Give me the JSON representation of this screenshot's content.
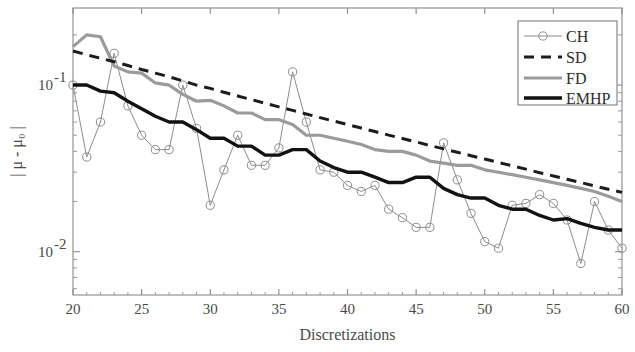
{
  "chart_data": {
    "type": "line",
    "title": "",
    "xlabel": "Discretizations",
    "ylabel": "| μ - μ₀ |",
    "yscale": "log",
    "xlim": [
      20,
      60
    ],
    "ylim": [
      0.0055,
      0.29
    ],
    "xticks": [
      20,
      25,
      30,
      35,
      40,
      45,
      50,
      55,
      60
    ],
    "xticklabels": [
      "20",
      "25",
      "30",
      "35",
      "40",
      "45",
      "50",
      "55",
      "60"
    ],
    "yticks": [
      0.1,
      0.01
    ],
    "yticklabels": [
      "10⁻¹",
      "10⁻²"
    ],
    "grid": false,
    "legend_position": "top-right",
    "x": [
      20,
      21,
      22,
      23,
      24,
      25,
      26,
      27,
      28,
      29,
      30,
      31,
      32,
      33,
      34,
      35,
      36,
      37,
      38,
      39,
      40,
      41,
      42,
      43,
      44,
      45,
      46,
      47,
      48,
      49,
      50,
      51,
      52,
      53,
      54,
      55,
      56,
      57,
      58,
      59,
      60
    ],
    "series": [
      {
        "name": "CH",
        "style": "thin-gray-circles",
        "color": "#8d8d8d",
        "marker": "circle",
        "values": [
          0.1,
          0.037,
          0.06,
          0.155,
          0.075,
          0.05,
          0.041,
          0.041,
          0.1,
          0.055,
          0.019,
          0.031,
          0.05,
          0.033,
          0.033,
          0.042,
          0.12,
          0.06,
          0.031,
          0.03,
          0.025,
          0.023,
          0.025,
          0.018,
          0.016,
          0.014,
          0.014,
          0.045,
          0.027,
          0.017,
          0.0115,
          0.0105,
          0.019,
          0.0195,
          0.022,
          0.0195,
          0.0155,
          0.0085,
          0.02,
          0.0135,
          0.0105
        ]
      },
      {
        "name": "SD",
        "style": "dashed-black",
        "color": "#1c1c1c",
        "marker": "none",
        "values": [
          0.16,
          0.152,
          0.145,
          0.138,
          0.131,
          0.124,
          0.118,
          0.112,
          0.106,
          0.1,
          0.0955,
          0.0905,
          0.086,
          0.0818,
          0.0778,
          0.074,
          0.0705,
          0.067,
          0.0638,
          0.0608,
          0.058,
          0.0552,
          0.0526,
          0.0501,
          0.0478,
          0.0456,
          0.0434,
          0.0414,
          0.0395,
          0.0377,
          0.036,
          0.0343,
          0.0328,
          0.0313,
          0.0298,
          0.0285,
          0.0272,
          0.026,
          0.0248,
          0.0237,
          0.0227
        ]
      },
      {
        "name": "FD",
        "style": "solid-gray",
        "color": "#9b9b9b",
        "marker": "none",
        "values": [
          0.17,
          0.2,
          0.195,
          0.13,
          0.12,
          0.118,
          0.103,
          0.1,
          0.088,
          0.08,
          0.081,
          0.075,
          0.068,
          0.068,
          0.062,
          0.062,
          0.058,
          0.05,
          0.05,
          0.048,
          0.046,
          0.044,
          0.041,
          0.04,
          0.04,
          0.038,
          0.035,
          0.034,
          0.033,
          0.033,
          0.031,
          0.03,
          0.029,
          0.028,
          0.027,
          0.026,
          0.025,
          0.024,
          0.023,
          0.0215,
          0.02
        ]
      },
      {
        "name": "EMHP",
        "style": "thick-black",
        "color": "#121212",
        "marker": "none",
        "values": [
          0.1,
          0.1,
          0.092,
          0.09,
          0.08,
          0.072,
          0.065,
          0.06,
          0.06,
          0.054,
          0.048,
          0.048,
          0.043,
          0.043,
          0.038,
          0.038,
          0.041,
          0.041,
          0.035,
          0.032,
          0.03,
          0.03,
          0.028,
          0.026,
          0.026,
          0.028,
          0.028,
          0.024,
          0.022,
          0.021,
          0.021,
          0.019,
          0.018,
          0.018,
          0.0165,
          0.0155,
          0.0158,
          0.0148,
          0.014,
          0.0135,
          0.0135
        ]
      }
    ]
  },
  "legend": {
    "entries": [
      {
        "label": "CH"
      },
      {
        "label": "SD"
      },
      {
        "label": "FD"
      },
      {
        "label": "EMHP"
      }
    ]
  }
}
